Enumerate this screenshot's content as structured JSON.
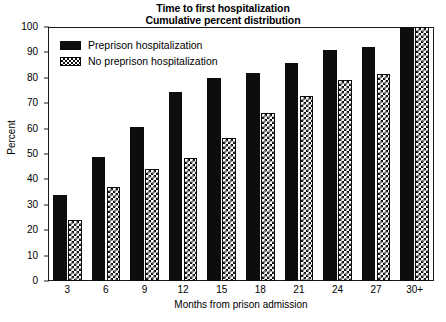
{
  "chart_data": {
    "type": "bar",
    "title": "Time to first hospitalization",
    "subtitle": "Cumulative percent distribution",
    "xlabel": "Months from prison admission",
    "ylabel": "Percent",
    "ylim": [
      0,
      100
    ],
    "ytick_step": 10,
    "ytick_labels": [
      "0",
      "10",
      "20",
      "30",
      "40",
      "50",
      "60",
      "70",
      "80",
      "90",
      "100"
    ],
    "grid": false,
    "legend_position": "top-left inside plot",
    "categories": [
      "3",
      "6",
      "9",
      "12",
      "15",
      "18",
      "21",
      "24",
      "27",
      "30+"
    ],
    "series": [
      {
        "name": "Preprison hospitalization",
        "pattern": "solid-black",
        "color": "#0d0d0d",
        "values": [
          34,
          49,
          60.5,
          74.5,
          80,
          82,
          86,
          91,
          92,
          100
        ]
      },
      {
        "name": "No preprison hospitalization",
        "pattern": "checkerboard-hatch",
        "color": "#0d0d0d",
        "values": [
          24,
          37,
          44,
          48.5,
          56.5,
          66,
          73,
          79,
          81.5,
          100
        ]
      }
    ]
  },
  "legend": {
    "items": [
      {
        "label": "Preprison hospitalization",
        "pattern": "solid"
      },
      {
        "label": "No preprison hospitalization",
        "pattern": "hatch"
      }
    ]
  }
}
